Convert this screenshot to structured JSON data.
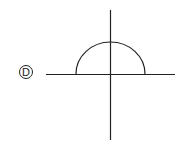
{
  "figure": {
    "option_label": "D",
    "stroke_color": "#222222",
    "background": "#ffffff",
    "axes": {
      "origin": [
        110,
        74
      ],
      "x_axis": {
        "from": 46,
        "to": 175
      },
      "y_axis": {
        "from": 10,
        "to": 140
      }
    },
    "curve": {
      "type": "upper semicircle",
      "left_x": 76,
      "right_x": 145,
      "top_y": 42,
      "baseline_y": 74
    }
  }
}
